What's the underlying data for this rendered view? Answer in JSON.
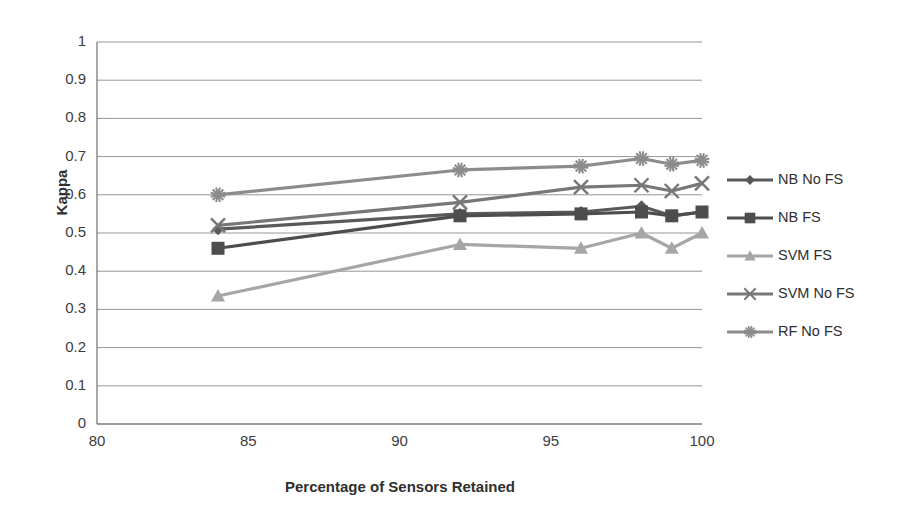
{
  "chart_data": {
    "type": "line",
    "title": "",
    "xlabel": "Percentage of Sensors Retained",
    "ylabel": "Kappa",
    "xlim": [
      80,
      100
    ],
    "ylim": [
      0,
      1
    ],
    "xticks": [
      80,
      85,
      90,
      95,
      100
    ],
    "yticks": [
      0,
      0.1,
      0.2,
      0.3,
      0.4,
      0.5,
      0.6,
      0.7,
      0.8,
      0.9,
      1
    ],
    "ytick_labels": [
      "0",
      "0.1",
      "0.2",
      "0.3",
      "0.4",
      "0.5",
      "0.6",
      "0.7",
      "0.8",
      "0.9",
      "1"
    ],
    "xtick_labels": [
      "80",
      "85",
      "90",
      "95",
      "100"
    ],
    "grid": "horizontal",
    "legend_position": "right",
    "x": [
      84,
      92,
      96,
      98,
      99,
      100
    ],
    "series": [
      {
        "name": "NB No FS",
        "marker": "diamond",
        "color": "#595959",
        "values": [
          0.51,
          0.55,
          0.555,
          0.57,
          0.545,
          0.555
        ]
      },
      {
        "name": "NB FS",
        "marker": "square",
        "color": "#4d4d4d",
        "values": [
          0.46,
          0.545,
          0.55,
          0.555,
          0.545,
          0.555
        ]
      },
      {
        "name": "SVM FS",
        "marker": "triangle",
        "color": "#a6a6a6",
        "values": [
          0.335,
          0.47,
          0.46,
          0.5,
          0.46,
          0.5
        ]
      },
      {
        "name": "SVM No FS",
        "marker": "cross",
        "color": "#777777",
        "values": [
          0.52,
          0.58,
          0.62,
          0.625,
          0.61,
          0.63
        ]
      },
      {
        "name": "RF No FS",
        "marker": "star",
        "color": "#8c8c8c",
        "values": [
          0.6,
          0.665,
          0.675,
          0.695,
          0.68,
          0.69
        ]
      }
    ]
  }
}
